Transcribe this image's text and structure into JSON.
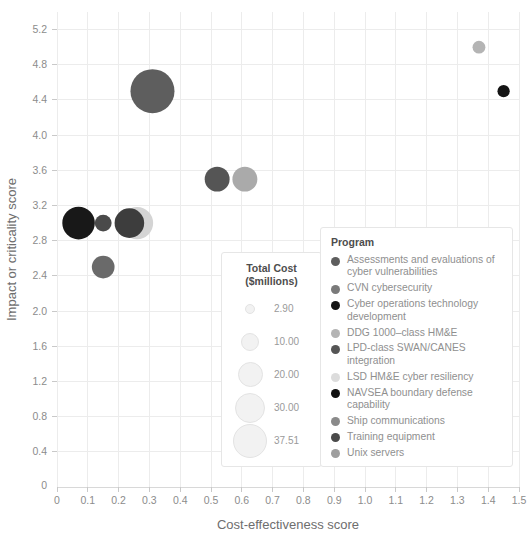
{
  "chart_data": {
    "type": "scatter",
    "title": "",
    "xlabel": "Cost-effectiveness score",
    "ylabel": "Impact or criticality score",
    "xlim": [
      0,
      1.5
    ],
    "ylim": [
      0,
      5.4
    ],
    "grid": true,
    "xticks": [
      "0",
      "0.1",
      "0.2",
      "0.3",
      "0.4",
      "0.5",
      "0.6",
      "0.7",
      "0.8",
      "0.9",
      "1.0",
      "1.1",
      "1.2",
      "1.3",
      "1.4",
      "1.5"
    ],
    "xtick_values": [
      0,
      0.1,
      0.2,
      0.3,
      0.4,
      0.5,
      0.6,
      0.7,
      0.8,
      0.9,
      1.0,
      1.1,
      1.2,
      1.3,
      1.4,
      1.5
    ],
    "yticks": [
      "0",
      "0.4",
      "0.8",
      "1.2",
      "1.6",
      "2.0",
      "2.4",
      "2.8",
      "3.2",
      "3.6",
      "4.0",
      "4.4",
      "4.8",
      "5.2"
    ],
    "ytick_values": [
      0,
      0.4,
      0.8,
      1.2,
      1.6,
      2.0,
      2.4,
      2.8,
      3.2,
      3.6,
      4.0,
      4.4,
      4.8,
      5.2
    ],
    "size_encoding": "Total Cost ($millions)",
    "color_encoding": "Program",
    "points": [
      {
        "label": "Assessments and evaluations of cyber vulnerabilities",
        "x": 0.31,
        "y": 4.5,
        "size": 37.51,
        "color": "#5e5e5e"
      },
      {
        "label": "CVN cybersecurity",
        "x": 0.15,
        "y": 3.0,
        "size": 5.5,
        "color": "#4a4a4a"
      },
      {
        "label": "Cyber operations technology development",
        "x": 1.45,
        "y": 4.5,
        "size": 2.9,
        "color": "#141414"
      },
      {
        "label": "DDG 1000-class HM&E",
        "x": 1.37,
        "y": 5.0,
        "size": 3.2,
        "color": "#b4b4b4"
      },
      {
        "label": "LPD-class SWAN/CANES integration",
        "x": 0.52,
        "y": 3.5,
        "size": 12.0,
        "color": "#555555"
      },
      {
        "label": "LSD HM&E cyber resiliency",
        "x": 0.26,
        "y": 3.0,
        "size": 20.0,
        "color": "#d4d4d4"
      },
      {
        "label": "NAVSEA boundary defense capability",
        "x": 0.07,
        "y": 3.0,
        "size": 20.5,
        "color": "#181818"
      },
      {
        "label": "Ship communications",
        "x": 0.61,
        "y": 3.5,
        "size": 12.0,
        "color": "#aaaaaa"
      },
      {
        "label": "Training equipment",
        "x": 0.235,
        "y": 3.0,
        "size": 17.0,
        "color": "#3d3d3d"
      },
      {
        "label": "Unix servers",
        "x": 0.15,
        "y": 2.5,
        "size": 10.0,
        "color": "#6a6a6a"
      }
    ]
  },
  "size_legend": {
    "title_line1": "Total Cost",
    "title_line2": "($millions)",
    "items": [
      {
        "value": "2.90",
        "r": 5.0
      },
      {
        "value": "10.00",
        "r": 9.0
      },
      {
        "value": "20.00",
        "r": 12.5
      },
      {
        "value": "30.00",
        "r": 15.0
      },
      {
        "value": "37.51",
        "r": 17.0
      }
    ]
  },
  "program_legend": {
    "title": "Program",
    "items": [
      {
        "label": "Assessments and evaluations of cyber vulnerabilities",
        "color": "#5e5e5e"
      },
      {
        "label": "CVN cybersecurity",
        "color": "#7a7a7a"
      },
      {
        "label": "Cyber operations technology development",
        "color": "#141414"
      },
      {
        "label": "DDG 1000–class HM&E",
        "color": "#b4b4b4"
      },
      {
        "label": "LPD-class SWAN/CANES integration",
        "color": "#555555"
      },
      {
        "label": "LSD HM&E cyber resiliency",
        "color": "#dcdcdc"
      },
      {
        "label": "NAVSEA boundary defense capability",
        "color": "#111111"
      },
      {
        "label": "Ship communications",
        "color": "#8a8a8a"
      },
      {
        "label": "Training equipment",
        "color": "#4a4a4a"
      },
      {
        "label": "Unix servers",
        "color": "#9e9e9e"
      }
    ]
  }
}
